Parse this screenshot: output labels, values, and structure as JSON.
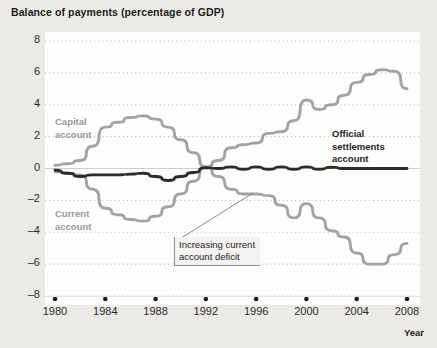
{
  "chart_data": {
    "type": "line",
    "title": "Balance of payments (percentage of GDP)",
    "xlabel": "Year",
    "ylabel": "",
    "xlim": [
      1980,
      2008
    ],
    "ylim": [
      -8,
      8
    ],
    "yticks": [
      8,
      6,
      4,
      2,
      0,
      -2,
      -4,
      -6,
      -8
    ],
    "ytick_labels": [
      "8",
      "6",
      "4",
      "2",
      "0",
      "–2",
      "–4",
      "–6",
      "–8"
    ],
    "xticks": [
      1980,
      1984,
      1988,
      1992,
      1996,
      2000,
      2004,
      2008
    ],
    "xtick_labels": [
      "1980",
      "1984",
      "1988",
      "1992",
      "1996",
      "2000",
      "2004",
      "2008"
    ],
    "grid": "dotted-horizontal",
    "legend_position": "inline-annotations",
    "series": [
      {
        "name": "Capital account",
        "color": "#a3a3a3",
        "x": [
          1980,
          1981,
          1982,
          1983,
          1984,
          1985,
          1986,
          1987,
          1988,
          1989,
          1990,
          1991,
          1992,
          1993,
          1994,
          1995,
          1996,
          1997,
          1998,
          1999,
          2000,
          2001,
          2002,
          2003,
          2004,
          2005,
          2006,
          2007,
          2008
        ],
        "values": [
          0.2,
          0.3,
          0.5,
          1.4,
          2.6,
          2.9,
          3.2,
          3.3,
          3.1,
          2.6,
          1.8,
          1.0,
          0.1,
          0.5,
          1.3,
          1.5,
          1.6,
          2.2,
          2.3,
          3.0,
          4.3,
          3.7,
          4.0,
          4.6,
          5.4,
          5.9,
          6.2,
          6.1,
          5.0
        ]
      },
      {
        "name": "Current account",
        "color": "#a3a3a3",
        "x": [
          1980,
          1981,
          1982,
          1983,
          1984,
          1985,
          1986,
          1987,
          1988,
          1989,
          1990,
          1991,
          1992,
          1993,
          1994,
          1995,
          1996,
          1997,
          1998,
          1999,
          2000,
          2001,
          2002,
          2003,
          2004,
          2005,
          2006,
          2007,
          2008
        ],
        "values": [
          -0.2,
          -0.3,
          -0.4,
          -1.3,
          -2.5,
          -2.9,
          -3.2,
          -3.3,
          -3.0,
          -2.4,
          -1.6,
          -0.8,
          0.1,
          -0.5,
          -1.3,
          -1.6,
          -1.6,
          -1.7,
          -2.3,
          -3.1,
          -2.2,
          -3.1,
          -3.9,
          -4.3,
          -5.3,
          -6.0,
          -6.0,
          -5.4,
          -4.7
        ]
      },
      {
        "name": "Official settlements account",
        "color": "#2b2b2b",
        "x": [
          1980,
          1981,
          1982,
          1983,
          1984,
          1985,
          1986,
          1987,
          1988,
          1989,
          1990,
          1991,
          1992,
          1993,
          1994,
          1995,
          1996,
          1997,
          1998,
          1999,
          2000,
          2001,
          2002,
          2003,
          2004,
          2005,
          2006,
          2007,
          2008
        ],
        "values": [
          -0.1,
          -0.3,
          -0.5,
          -0.4,
          -0.4,
          -0.4,
          -0.35,
          -0.3,
          -0.5,
          -0.75,
          -0.5,
          -0.25,
          0.05,
          0.0,
          0.1,
          -0.05,
          0.1,
          -0.05,
          0.1,
          -0.05,
          0.1,
          -0.05,
          0.08,
          0.0,
          0.0,
          0.0,
          0.0,
          0.0,
          0.0
        ]
      }
    ],
    "annotations": [
      {
        "name": "capital-account-label",
        "text": "Capital\naccount",
        "line1": "Capital",
        "line2": "account",
        "style": "grey-bold"
      },
      {
        "name": "current-account-label",
        "text": "Current\naccount",
        "line1": "Current",
        "line2": "account",
        "style": "grey-bold"
      },
      {
        "name": "official-settlements-label",
        "line1": "Official",
        "line2": "settlements",
        "line3": "account",
        "style": "dark-bold"
      },
      {
        "name": "callout-increasing-deficit",
        "line1": "Increasing current",
        "line2": "account deficit",
        "style": "box-with-leader"
      }
    ]
  },
  "axis_name": "Year"
}
